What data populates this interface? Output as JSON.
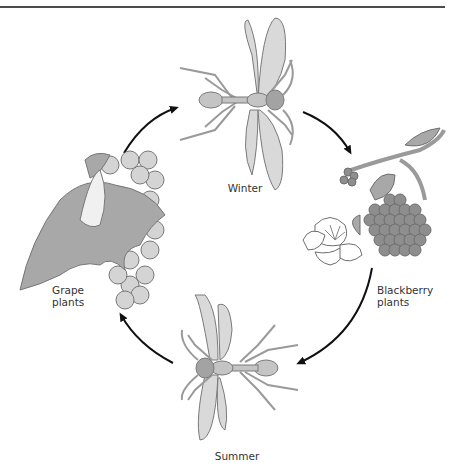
{
  "diagram": {
    "type": "life-cycle",
    "stages": [
      {
        "id": "winter",
        "label": "Winter"
      },
      {
        "id": "blackberry",
        "label_lines": [
          "Blackberry",
          "plants"
        ]
      },
      {
        "id": "summer",
        "label": "Summer"
      },
      {
        "id": "grape",
        "label_lines": [
          "Grape",
          "plants"
        ]
      }
    ],
    "flow": [
      "winter",
      "blackberry",
      "summer",
      "grape",
      "winter"
    ],
    "colors": {
      "line": "#111111",
      "wing": "#d9d9d9",
      "body": "#bdbdbd",
      "outline": "#777777",
      "berry": "#8e8e8e",
      "grape": "#d4d4d4",
      "leaf": "#a8a8a8"
    }
  }
}
